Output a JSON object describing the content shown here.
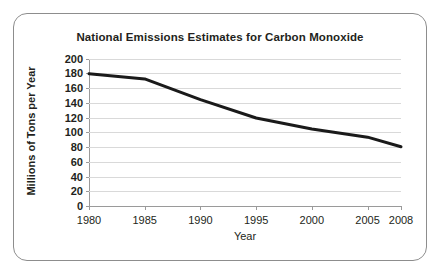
{
  "frame": {
    "border_color": "#8d8d8d",
    "background": "#ffffff"
  },
  "chart_data": {
    "type": "line",
    "title": "National Emissions Estimates for Carbon Monoxide",
    "xlabel": "Year",
    "ylabel": "Millions of Tons per Year",
    "x": [
      1980,
      1985,
      1990,
      1995,
      2000,
      2005,
      2008
    ],
    "categories": [
      "1980",
      "1985",
      "1990",
      "1995",
      "2000",
      "2005",
      "2008"
    ],
    "values": [
      180,
      173,
      145,
      120,
      105,
      94,
      81
    ],
    "series": [
      {
        "name": "Carbon Monoxide Emissions",
        "values": [
          180,
          173,
          145,
          120,
          105,
          94,
          81
        ],
        "color": "#1a1a1a"
      }
    ],
    "xlim": [
      1980,
      2008
    ],
    "ylim": [
      0,
      200
    ],
    "ytick_labels": [
      "200",
      "180",
      "160",
      "140",
      "120",
      "100",
      "80",
      "60",
      "40",
      "20",
      "0"
    ],
    "ytick_values": [
      200,
      180,
      160,
      140,
      120,
      100,
      80,
      60,
      40,
      20,
      0
    ],
    "ytick_step": 20,
    "xtick_labels": [
      "1980",
      "1985",
      "1990",
      "1995",
      "2000",
      "2005",
      "2008"
    ],
    "grid": "horizontal",
    "grid_color": "#d9d9d9",
    "axis_color": "#9a9a9a",
    "legend": "none",
    "line_width_px": 3
  }
}
